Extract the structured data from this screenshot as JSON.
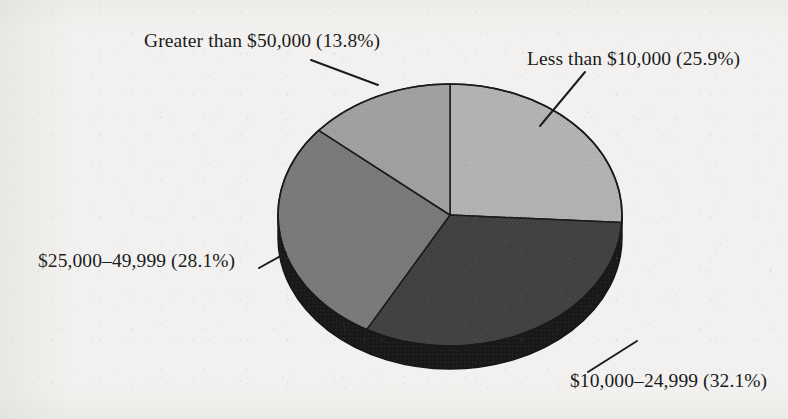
{
  "chart_data": {
    "type": "pie",
    "title": "",
    "style": "3d-exploded-none",
    "start_angle_deg": 0,
    "direction": "clockwise",
    "categories": [
      "Less than $10,000",
      "$10,000–24,999",
      "$25,000–49,999",
      "Greater than $50,000"
    ],
    "values": [
      25.9,
      32.1,
      28.1,
      13.8
    ],
    "value_unit": "percent",
    "labels": [
      "Less than $10,000 (25.9%)",
      "$10,000–24,999 (32.1%)",
      "$25,000–49,999 (28.1%)",
      "Greater than $50,000 (13.8%)"
    ],
    "slice_colors": [
      "#b0b0b0",
      "#404040",
      "#787878",
      "#9e9e9e"
    ],
    "side_color": "#171717",
    "outline_color": "#1a1a1a",
    "legend": "none",
    "leader_lines": true,
    "xlabel": "",
    "ylabel": ""
  },
  "slices": {
    "less_than_10000": {
      "label": "Less than $10,000 (25.9%)",
      "name": "Less than $10,000",
      "percent": "25.9%",
      "color": "#b0b0b0"
    },
    "range_10000_24999": {
      "label": "$10,000–24,999 (32.1%)",
      "name": "$10,000–24,999",
      "percent": "32.1%",
      "color": "#404040"
    },
    "range_25000_49999": {
      "label": "$25,000–49,999 (28.1%)",
      "name": "$25,000–49,999",
      "percent": "28.1%",
      "color": "#787878"
    },
    "greater_than_50000": {
      "label": "Greater than $50,000 (13.8%)",
      "name": "Greater than $50,000",
      "percent": "13.8%",
      "color": "#9e9e9e"
    }
  },
  "colors": {
    "background": "#f2f1ef",
    "text": "#1b1b1b",
    "outline": "#1a1a1a",
    "pie_side": "#171717"
  }
}
